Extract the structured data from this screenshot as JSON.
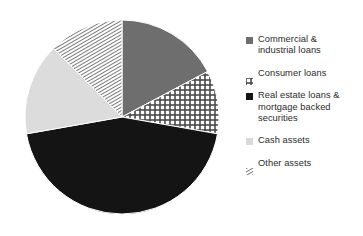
{
  "chart_data": {
    "type": "pie",
    "title": "",
    "subtitle": "",
    "xlabel": "",
    "ylabel": "",
    "grid": false,
    "legend_position": "right",
    "start_angle_deg": 0,
    "direction": "clockwise",
    "categories": [
      "Commercial & industrial loans",
      "Consumer loans",
      "Real estate loans & mortgage backed securities",
      "Cash assets",
      "Other assets"
    ],
    "values": [
      17.2,
      10.5,
      44.4,
      15.3,
      12.6
    ],
    "slices": [
      {
        "label": "Commercial & industrial loans",
        "value": 17.2,
        "start_deg": 0,
        "end_deg": 62,
        "fill": "solid",
        "color": "#6e6e6e",
        "pattern_name": "solid-medium-gray"
      },
      {
        "label": "Consumer loans",
        "value": 10.5,
        "start_deg": 62,
        "end_deg": 100,
        "fill": "pattern",
        "color": "#4a4a4a",
        "pattern_name": "grid-checker"
      },
      {
        "label": "Real estate loans & mortgage backed securities",
        "value": 44.4,
        "start_deg": 100,
        "end_deg": 260,
        "fill": "solid",
        "color": "#141414",
        "pattern_name": "solid-black"
      },
      {
        "label": "Cash assets",
        "value": 15.3,
        "start_deg": 260,
        "end_deg": 315,
        "fill": "solid",
        "color": "#dcdcdc",
        "pattern_name": "solid-light-gray"
      },
      {
        "label": "Other assets",
        "value": 12.6,
        "start_deg": 315,
        "end_deg": 360,
        "fill": "pattern",
        "color": "#555555",
        "pattern_name": "diagonal-hatch-fine"
      }
    ],
    "geometry": {
      "center_x": 122,
      "center_y": 117,
      "radius": 97
    }
  },
  "legend": {
    "items": [
      {
        "label": "Commercial &\nindustrial loans",
        "swatch": "solid-medium-gray-square-icon"
      },
      {
        "label": "Consumer loans",
        "swatch": "grid-checker-square-icon"
      },
      {
        "label": "Real estate loans &\nmortgage backed\nsecurities",
        "swatch": "solid-black-square-icon"
      },
      {
        "label": "Cash assets",
        "swatch": "solid-light-gray-square-icon"
      },
      {
        "label": "Other assets",
        "swatch": "diagonal-hatch-square-icon"
      }
    ]
  },
  "colors": {
    "background": "#ffffff",
    "text": "#2b2b2b",
    "commercial_industrial": "#6e6e6e",
    "consumer": "#4a4a4a",
    "real_estate": "#141414",
    "cash": "#dcdcdc",
    "other": "#555555"
  }
}
